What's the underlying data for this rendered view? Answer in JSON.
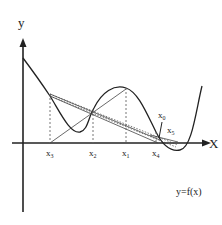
{
  "diagram": {
    "axes": {
      "y_label": "y",
      "x_label": "X"
    },
    "function_label": "y=f(x)",
    "points": [
      {
        "name": "x3",
        "base": "x",
        "sub": "3"
      },
      {
        "name": "x2",
        "base": "x",
        "sub": "2"
      },
      {
        "name": "x1",
        "base": "x",
        "sub": "1"
      },
      {
        "name": "x4",
        "base": "x",
        "sub": "4"
      },
      {
        "name": "x0",
        "base": "x",
        "sub": "0"
      },
      {
        "name": "x5",
        "base": "x",
        "sub": "5"
      }
    ],
    "colors": {
      "stroke": "#222222",
      "dashed": "#666666"
    }
  }
}
